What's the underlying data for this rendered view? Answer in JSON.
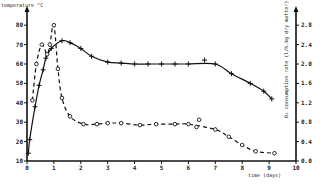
{
  "chart_data": {
    "type": "line",
    "title": "",
    "xlabel": "time (days)",
    "ylabel_left": "temperature °C",
    "ylabel_right": "O2 consumption rate (l/h.kg dry matter)",
    "xlim": [
      0,
      10
    ],
    "ylim_left": [
      10,
      85
    ],
    "ylim_right": [
      0.0,
      3.0
    ],
    "x_ticks": [
      0,
      1,
      2,
      3,
      4,
      5,
      6,
      7,
      8,
      9,
      10
    ],
    "y_ticks_left": [
      10,
      20,
      30,
      40,
      50,
      60,
      70,
      80
    ],
    "y_ticks_right": [
      "0.0",
      "0.4",
      "0.8",
      "1.2",
      "1.6",
      "2.0",
      "2.4",
      "2.8"
    ],
    "grid": false,
    "legend": null,
    "series": [
      {
        "name": "temperature",
        "axis": "left",
        "style": "solid",
        "marker": "+",
        "points": [
          [
            0.05,
            14
          ],
          [
            0.1,
            21
          ],
          [
            0.3,
            38
          ],
          [
            0.45,
            49
          ],
          [
            0.6,
            57
          ],
          [
            0.7,
            63
          ],
          [
            0.9,
            68
          ],
          [
            1.3,
            72
          ],
          [
            1.6,
            71
          ],
          [
            2.0,
            68
          ],
          [
            2.4,
            64
          ],
          [
            3.0,
            61
          ],
          [
            3.5,
            60.5
          ],
          [
            4.0,
            60
          ],
          [
            4.5,
            60
          ],
          [
            5.0,
            60
          ],
          [
            5.5,
            60
          ],
          [
            6.0,
            60
          ],
          [
            6.6,
            62
          ],
          [
            7.0,
            60
          ],
          [
            7.6,
            55
          ],
          [
            8.3,
            50
          ],
          [
            8.8,
            46
          ],
          [
            9.1,
            42
          ]
        ]
      },
      {
        "name": "O2 consumption rate",
        "axis": "right",
        "style": "dashed",
        "marker": "o",
        "points": [
          [
            0.2,
            1.25
          ],
          [
            0.35,
            2.0
          ],
          [
            0.55,
            2.4
          ],
          [
            0.75,
            2.2
          ],
          [
            0.85,
            2.4
          ],
          [
            1.0,
            2.8
          ],
          [
            1.15,
            1.9
          ],
          [
            1.3,
            1.3
          ],
          [
            1.6,
            0.92
          ],
          [
            2.1,
            0.76
          ],
          [
            2.6,
            0.76
          ],
          [
            3.0,
            0.78
          ],
          [
            3.5,
            0.78
          ],
          [
            4.2,
            0.74
          ],
          [
            4.8,
            0.76
          ],
          [
            5.5,
            0.76
          ],
          [
            6.0,
            0.76
          ],
          [
            6.3,
            0.7
          ],
          [
            6.4,
            0.85
          ],
          [
            7.0,
            0.65
          ],
          [
            7.5,
            0.5
          ],
          [
            8.0,
            0.33
          ],
          [
            8.5,
            0.2
          ],
          [
            9.2,
            0.16
          ]
        ]
      }
    ]
  },
  "labels": {
    "y_left_title": "temperature °C",
    "x_title": "time (days)",
    "y_right_title": "O₂ consumption rate (l/h.kg dry matter)"
  }
}
